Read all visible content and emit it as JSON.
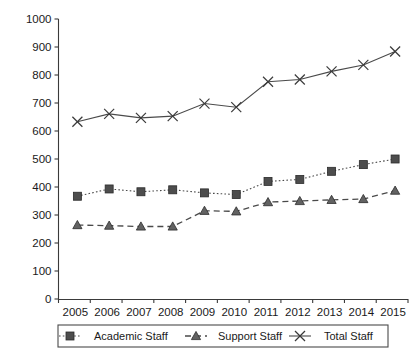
{
  "chart_data": {
    "type": "line",
    "title": "",
    "xlabel": "",
    "ylabel": "",
    "categories": [
      "2005",
      "2006",
      "2007",
      "2008",
      "2009",
      "2010",
      "2011",
      "2012",
      "2013",
      "2014",
      "2015"
    ],
    "ylim": [
      0,
      1000
    ],
    "ytick_step": 100,
    "yticks": [
      "0",
      "100",
      "200",
      "300",
      "400",
      "500",
      "600",
      "700",
      "800",
      "900",
      "1000"
    ],
    "grid": false,
    "legend_position": "bottom",
    "series": [
      {
        "name": "Academic Staff",
        "marker": "square",
        "linestyle": "dotted",
        "color": "#4d4d4d",
        "values": [
          367,
          393,
          383,
          390,
          379,
          373,
          420,
          427,
          456,
          480,
          500
        ]
      },
      {
        "name": "Support Staff",
        "marker": "triangle",
        "linestyle": "dashed",
        "color": "#626262",
        "values": [
          264,
          262,
          259,
          259,
          315,
          313,
          346,
          350,
          354,
          357,
          387
        ]
      },
      {
        "name": "Total Staff",
        "marker": "cross",
        "linestyle": "solid",
        "color": "#3a3a3a",
        "values": [
          633,
          661,
          647,
          653,
          698,
          685,
          776,
          784,
          813,
          836,
          884
        ]
      }
    ]
  },
  "legend": {
    "entries": [
      {
        "label": "Academic Staff"
      },
      {
        "label": "Support Staff"
      },
      {
        "label": "Total Staff"
      }
    ]
  }
}
